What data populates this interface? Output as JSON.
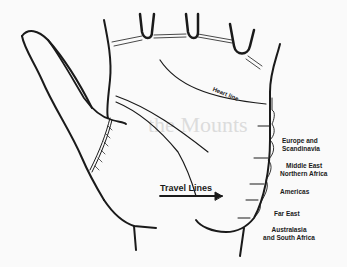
{
  "figure": {
    "labels": {
      "heart_line": "Heart line",
      "travel_lines": "Travel Lines",
      "regions": [
        {
          "line1": "Europe and",
          "line2": "Scandinavia"
        },
        {
          "line1": "Middle East",
          "line2": "Northern Africa"
        },
        {
          "line1": "Americas",
          "line2": ""
        },
        {
          "line1": "Far East",
          "line2": ""
        },
        {
          "line1": "Australasia",
          "line2": "and South Africa"
        }
      ]
    },
    "background_bleed_text": "the Mounts",
    "colors": {
      "ink": "#1a1a1a",
      "paper": "#fafafa",
      "bleed": "#dcdcdc"
    }
  }
}
